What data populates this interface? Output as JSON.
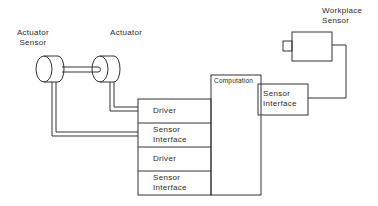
{
  "diagram": {
    "labels": {
      "actuator_sensor_line1": "Actuator",
      "actuator_sensor_line2": "Sensor",
      "actuator": "Actuator",
      "workplace_sensor_line1": "Workplace",
      "workplace_sensor_line2": "Sensor",
      "computation": "Computation",
      "right_sensor_interface_line1": "Sensor",
      "right_sensor_interface_line2": "Interface"
    },
    "stack": [
      {
        "line1": "Driver",
        "line2": ""
      },
      {
        "line1": "Sensor",
        "line2": "Interface"
      },
      {
        "line1": "Driver",
        "line2": ""
      },
      {
        "line1": "Sensor",
        "line2": "Interface"
      }
    ],
    "colors": {
      "stroke": "#333333",
      "background": "#ffffff"
    }
  }
}
